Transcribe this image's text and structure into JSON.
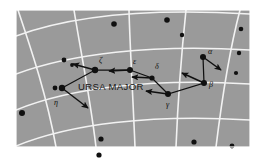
{
  "figure": {
    "title": "URSA MAJOR",
    "panel": {
      "x": 16,
      "y": 10,
      "width": 234,
      "height": 137,
      "background_color": "#9a9a9a",
      "grid_color": "#f2f2f2",
      "border_color": "#ffffff"
    },
    "constellation_label": {
      "text": "URSA MAJOR",
      "x": 78,
      "y": 90
    }
  },
  "chart_data": {
    "type": "scatter",
    "title": "URSA MAJOR",
    "subtitle": "",
    "xlabel": "",
    "ylabel": "",
    "grid": true,
    "legend": "none",
    "background_color": "#9a9a9a",
    "grid_color": "#f2f2f2",
    "star_color": "#101010",
    "arrow_color": "#101010",
    "named_stars": [
      {
        "label": "η",
        "name": "eta",
        "x": 62,
        "y": 88,
        "r": 3.2,
        "label_dx": -8,
        "label_dy": 17,
        "arrow_dx": 26,
        "arrow_dy": 20
      },
      {
        "label": "ζ",
        "name": "zeta",
        "x": 95,
        "y": 70,
        "r": 3.2,
        "label_dx": 4,
        "label_dy": -7,
        "arrow_dx": -22,
        "arrow_dy": -6
      },
      {
        "label": "ε",
        "name": "epsilon",
        "x": 130,
        "y": 70,
        "r": 3.0,
        "label_dx": 3,
        "label_dy": -6,
        "arrow_dx": -21,
        "arrow_dy": 1
      },
      {
        "label": "δ",
        "name": "delta",
        "x": 152,
        "y": 78,
        "r": 2.6,
        "label_dx": 3,
        "label_dy": -9,
        "arrow_dx": -20,
        "arrow_dy": -1
      },
      {
        "label": "γ",
        "name": "gamma",
        "x": 168,
        "y": 94,
        "r": 3.0,
        "label_dx": -2,
        "label_dy": 13,
        "arrow_dx": -22,
        "arrow_dy": -3
      },
      {
        "label": "β",
        "name": "beta",
        "x": 204,
        "y": 83,
        "r": 3.0,
        "label_dx": 5,
        "label_dy": 4,
        "arrow_dx": -22,
        "arrow_dy": -10
      },
      {
        "label": "α",
        "name": "alpha",
        "x": 203,
        "y": 57,
        "r": 3.0,
        "label_dx": 5,
        "label_dy": -3,
        "arrow_dx": 18,
        "arrow_dy": 13
      }
    ],
    "dipper_outline": [
      {
        "x": 62,
        "y": 88
      },
      {
        "x": 95,
        "y": 70
      },
      {
        "x": 130,
        "y": 70
      },
      {
        "x": 152,
        "y": 78
      },
      {
        "x": 168,
        "y": 94
      },
      {
        "x": 204,
        "y": 83
      },
      {
        "x": 203,
        "y": 57
      }
    ],
    "field_stars": [
      {
        "x": 114,
        "y": 24,
        "r": 2.8
      },
      {
        "x": 167,
        "y": 20,
        "r": 2.8
      },
      {
        "x": 182,
        "y": 35,
        "r": 2.2
      },
      {
        "x": 241,
        "y": 29,
        "r": 2.3
      },
      {
        "x": 239,
        "y": 53,
        "r": 2.2
      },
      {
        "x": 236,
        "y": 73,
        "r": 2.1
      },
      {
        "x": 64,
        "y": 60,
        "r": 2.4
      },
      {
        "x": 72,
        "y": 65,
        "r": 1.9
      },
      {
        "x": 55,
        "y": 88,
        "r": 2.4
      },
      {
        "x": 22,
        "y": 113,
        "r": 3.0
      },
      {
        "x": 101,
        "y": 139,
        "r": 2.6
      },
      {
        "x": 194,
        "y": 142,
        "r": 2.6
      },
      {
        "x": 232,
        "y": 146,
        "r": 2.4
      },
      {
        "x": 99,
        "y": 155,
        "r": 2.6
      }
    ],
    "grid_lines": {
      "description": "celestial coordinate grid, curved meridians and parallels",
      "meridians": [
        "M 18 10 C 30 46, 46 92, 56 147",
        "M 74 10 C 80 48, 90 96, 96 147",
        "M 129 10 C 130 48, 133 98, 135 147",
        "M 186 10 C 182 48, 178 98, 176 147",
        "M 240 10 C 230 48, 222 98, 216 147"
      ],
      "parallels": [
        "M 16 36 C 70 16, 150 8, 250 14",
        "M 16 74 C 70 54, 150 44, 250 50",
        "M 16 110 C 70 88, 150 78, 250 84",
        "M 16 146 C 70 124, 150 114, 250 120"
      ]
    }
  }
}
